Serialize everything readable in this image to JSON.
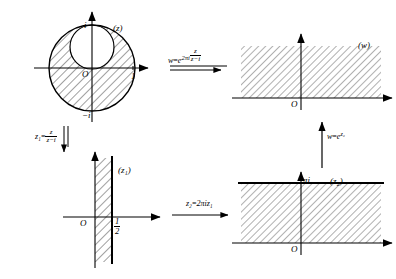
{
  "figure": {
    "ink_color": "#000000",
    "hatch_color": "#2b2b2b",
    "background": "#ffffff"
  },
  "panels": {
    "z_plane": {
      "tag": "(z)",
      "origin_label": "O",
      "tick_i": "i",
      "tick_minus_i": "−i",
      "tick_one": "1",
      "outer_circle": {
        "cx": 92,
        "cy": 68,
        "r": 43
      },
      "inner_circle": {
        "cx": 92,
        "cy": 47,
        "r": 22
      },
      "shaded_region": "region between outer unit circle and inner tangent circle"
    },
    "z1_plane": {
      "tag": "(z₁)",
      "origin_label": "O",
      "tick_half_num": "1",
      "tick_half_den": "2",
      "strip": {
        "left_x": 95,
        "right_x": 112,
        "top_y": 158,
        "bottom_y": 262
      },
      "shaded_region": "vertical strip 0 < Re z₁ < 1/2"
    },
    "z2_plane": {
      "tag": "(z₂)",
      "origin_label": "O",
      "tick_pi_i": "πi",
      "strip": {
        "left_x": 241,
        "right_x": 381,
        "top_y": 183,
        "bottom_y": 243
      },
      "shaded_region": "horizontal strip 0 < Im z₂ < π"
    },
    "w_plane": {
      "tag": "(w)",
      "origin_label": "O",
      "shaded_region": "upper half-plane Im w > 0",
      "region_box": {
        "left_x": 241,
        "right_x": 381,
        "top_y": 46,
        "bottom_y": 98
      }
    }
  },
  "maps": {
    "z_to_w": {
      "lhs": "w",
      "eq": "=",
      "base": "e",
      "exp_coef": "2πi",
      "exp_frac_num": "z",
      "exp_frac_den": "z−i",
      "direction": "right",
      "full_text": "w = e^{2πi z/(z−i)}"
    },
    "z_to_z1": {
      "lhs": "z₁",
      "eq": "=",
      "frac_num": "z",
      "frac_den": "z−i",
      "direction": "down",
      "full_text": "z₁ = z/(z−i)"
    },
    "z1_to_z2": {
      "lhs": "z₂",
      "eq": "=",
      "rhs": "2πiz₁",
      "direction": "right",
      "full_text": "z₂ = 2πi z₁"
    },
    "z2_to_w": {
      "lhs": "w",
      "eq": "=",
      "base": "e",
      "exp": "z₂",
      "direction": "up",
      "full_text": "w = e^{z₂}"
    }
  }
}
